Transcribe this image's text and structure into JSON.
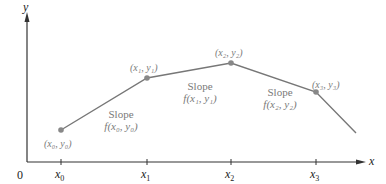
{
  "diagram": {
    "axes": {
      "x_label": "x",
      "y_label": "y",
      "origin_label": "0"
    },
    "ticks": [
      {
        "label": "x0",
        "base": "x",
        "sub": "0"
      },
      {
        "label": "x1",
        "base": "x",
        "sub": "1"
      },
      {
        "label": "x2",
        "base": "x",
        "sub": "2"
      },
      {
        "label": "x3",
        "base": "x",
        "sub": "3"
      }
    ],
    "points": [
      {
        "label": "(x0, y0)",
        "text": "(x₀, y₀)"
      },
      {
        "label": "(x1, y1)",
        "text": "(x₁, y₁)"
      },
      {
        "label": "(x2, y2)",
        "text": "(x₂, y₂)"
      },
      {
        "label": "(x3, y3)",
        "text": "(x₃, y₃)"
      }
    ],
    "slopes": [
      {
        "word": "Slope",
        "expr": "f(x₀, y₀)"
      },
      {
        "word": "Slope",
        "expr": "f(x₁, y₁)"
      },
      {
        "word": "Slope",
        "expr": "f(x₂, y₂)"
      }
    ],
    "colors": {
      "axis": "#333333",
      "segment": "#777777",
      "point": "#888888",
      "label": "#7a7a7a"
    }
  }
}
